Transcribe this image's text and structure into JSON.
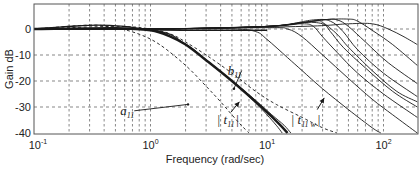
{
  "chart_data": {
    "type": "line",
    "title": "",
    "xlabel": "Frequency (rad/sec)",
    "ylabel": "Gain dB",
    "xscale": "log",
    "xlim": [
      0.1,
      195
    ],
    "ylim": [
      -40,
      10
    ],
    "grid": true,
    "x_ticks": [
      0.1,
      1,
      10,
      100
    ],
    "x_tick_labels": [
      {
        "base": "10",
        "exp": "-1"
      },
      {
        "base": "10",
        "exp": "0"
      },
      {
        "base": "10",
        "exp": "1"
      },
      {
        "base": "10",
        "exp": "2"
      }
    ],
    "y_ticks": [
      0,
      -10,
      -20,
      -30,
      -40
    ],
    "y_tick_labels": [
      "0",
      "-10",
      "-20",
      "-30",
      "-40"
    ],
    "series": [
      {
        "name": "a11",
        "style": "dashed",
        "width": 0.9,
        "points": [
          [
            0.1,
            0
          ],
          [
            0.3,
            1.5
          ],
          [
            0.5,
            0.5
          ],
          [
            0.8,
            -2
          ],
          [
            1.2,
            -6
          ],
          [
            2,
            -14
          ],
          [
            3,
            -22
          ],
          [
            4,
            -28
          ],
          [
            5,
            -33
          ],
          [
            6,
            -37
          ],
          [
            7,
            -40
          ]
        ]
      },
      {
        "name": "b11",
        "style": "dashed",
        "width": 0.9,
        "points": [
          [
            0.1,
            0
          ],
          [
            0.5,
            1
          ],
          [
            1,
            0
          ],
          [
            1.5,
            -2
          ],
          [
            2,
            -5
          ],
          [
            3,
            -10
          ],
          [
            5,
            -17
          ],
          [
            8,
            -24
          ],
          [
            12,
            -29
          ],
          [
            20,
            -34
          ],
          [
            30,
            -38
          ],
          [
            40,
            -40
          ]
        ]
      },
      {
        "name": "|t11| (nominal, bold)",
        "style": "solid",
        "width": 2.4,
        "points": [
          [
            0.1,
            0
          ],
          [
            0.5,
            0.3
          ],
          [
            1,
            -0.5
          ],
          [
            1.5,
            -3
          ],
          [
            2,
            -6
          ],
          [
            3,
            -12
          ],
          [
            5,
            -20
          ],
          [
            8,
            -28
          ],
          [
            10,
            -32
          ],
          [
            13,
            -37
          ],
          [
            15,
            -40
          ]
        ]
      },
      {
        "name": "|t11| variant 1",
        "style": "solid",
        "width": 0.9,
        "points": [
          [
            0.1,
            0
          ],
          [
            1,
            -0.5
          ],
          [
            2,
            -6
          ],
          [
            3,
            -12
          ],
          [
            5,
            -20
          ],
          [
            8,
            -28.5
          ],
          [
            10,
            -33
          ],
          [
            12,
            -37
          ],
          [
            13.5,
            -40
          ]
        ]
      },
      {
        "name": "|t11| variant 2",
        "style": "solid",
        "width": 0.9,
        "points": [
          [
            0.1,
            0
          ],
          [
            1,
            -0.4
          ],
          [
            2,
            -5.8
          ],
          [
            3,
            -11.8
          ],
          [
            5,
            -19.8
          ],
          [
            8,
            -27.5
          ],
          [
            11,
            -33
          ],
          [
            14,
            -37
          ],
          [
            16,
            -40
          ]
        ]
      },
      {
        "name": "|t11 w| 1",
        "style": "solid",
        "width": 0.9,
        "points": [
          [
            0.1,
            0
          ],
          [
            1,
            0
          ],
          [
            5,
            0
          ],
          [
            8,
            -1
          ],
          [
            10,
            -4
          ],
          [
            15,
            -11
          ],
          [
            20,
            -16
          ],
          [
            30,
            -23
          ],
          [
            50,
            -31
          ],
          [
            80,
            -38
          ],
          [
            95,
            -40
          ]
        ]
      },
      {
        "name": "|t11 w| 2",
        "style": "solid",
        "width": 0.9,
        "points": [
          [
            0.1,
            0
          ],
          [
            1,
            0
          ],
          [
            10,
            0.5
          ],
          [
            15,
            0
          ],
          [
            20,
            -3
          ],
          [
            30,
            -10
          ],
          [
            50,
            -19
          ],
          [
            80,
            -27
          ],
          [
            120,
            -33
          ],
          [
            195,
            -40
          ]
        ]
      },
      {
        "name": "|t11 w| 3",
        "style": "solid",
        "width": 0.9,
        "points": [
          [
            0.1,
            0
          ],
          [
            1,
            0
          ],
          [
            10,
            1
          ],
          [
            20,
            2
          ],
          [
            25,
            1
          ],
          [
            30,
            -3
          ],
          [
            40,
            -9
          ],
          [
            60,
            -17
          ],
          [
            100,
            -25
          ],
          [
            195,
            -34
          ]
        ]
      },
      {
        "name": "|t11 w| 4",
        "style": "solid",
        "width": 0.9,
        "points": [
          [
            0.1,
            0
          ],
          [
            1,
            0
          ],
          [
            10,
            1
          ],
          [
            20,
            2.5
          ],
          [
            30,
            2
          ],
          [
            35,
            -1
          ],
          [
            45,
            -7
          ],
          [
            70,
            -15
          ],
          [
            120,
            -24
          ],
          [
            195,
            -30
          ]
        ]
      },
      {
        "name": "|t11 w| 5",
        "style": "solid",
        "width": 0.9,
        "points": [
          [
            0.1,
            0
          ],
          [
            1,
            0
          ],
          [
            10,
            1
          ],
          [
            25,
            3
          ],
          [
            30,
            2.5
          ],
          [
            40,
            -2
          ],
          [
            50,
            -7
          ],
          [
            80,
            -16
          ],
          [
            130,
            -24
          ],
          [
            195,
            -28
          ]
        ]
      },
      {
        "name": "|t11 w| 6",
        "style": "solid",
        "width": 0.9,
        "points": [
          [
            0.1,
            0
          ],
          [
            1,
            0
          ],
          [
            10,
            1
          ],
          [
            25,
            3.5
          ],
          [
            35,
            3
          ],
          [
            45,
            -1
          ],
          [
            60,
            -8
          ],
          [
            100,
            -17
          ],
          [
            195,
            -26
          ]
        ]
      },
      {
        "name": "|t11 w| 7",
        "style": "solid",
        "width": 0.9,
        "points": [
          [
            0.1,
            0
          ],
          [
            1,
            0
          ],
          [
            10,
            1
          ],
          [
            30,
            3.5
          ],
          [
            40,
            3.5
          ],
          [
            50,
            1
          ],
          [
            70,
            -5
          ],
          [
            110,
            -13
          ],
          [
            195,
            -21
          ]
        ]
      },
      {
        "name": "|t11 w| 8",
        "style": "solid",
        "width": 0.9,
        "points": [
          [
            0.1,
            0
          ],
          [
            1,
            0
          ],
          [
            10,
            1
          ],
          [
            30,
            3.5
          ],
          [
            50,
            3.8
          ],
          [
            60,
            3
          ],
          [
            80,
            -0.5
          ],
          [
            120,
            -6
          ],
          [
            195,
            -14
          ]
        ]
      },
      {
        "name": "|t11 w| 9",
        "style": "solid",
        "width": 0.9,
        "points": [
          [
            0.1,
            0
          ],
          [
            1,
            0
          ],
          [
            20,
            1
          ],
          [
            50,
            2
          ],
          [
            80,
            2
          ],
          [
            110,
            0
          ],
          [
            150,
            -3
          ],
          [
            195,
            -6
          ]
        ]
      },
      {
        "name": "low-frequency bump",
        "style": "solid",
        "width": 1.4,
        "points": [
          [
            0.1,
            0
          ],
          [
            0.2,
            1
          ],
          [
            0.35,
            1.5
          ],
          [
            0.6,
            1
          ],
          [
            1,
            -0.2
          ],
          [
            3,
            -0.5
          ],
          [
            10,
            -0.5
          ]
        ]
      }
    ],
    "annotations": [
      {
        "text": "a",
        "sub": "11",
        "x": 0.55,
        "y": -33,
        "arrow_to": [
          2.1,
          -29
        ]
      },
      {
        "text": "b",
        "sub": "11",
        "x": 4.6,
        "y": -17.5,
        "arrow_to": [
          5.2,
          -23
        ]
      },
      {
        "text": "| t",
        "sub": "11",
        "tail": "|",
        "x": 3.7,
        "y": -36.5,
        "arrow_from": [
          4.9,
          -32
        ],
        "arrow_to": [
          5.8,
          -28
        ]
      },
      {
        "text": "| t",
        "sub": "11 w",
        "tail": "|",
        "x": 16,
        "y": -36.5,
        "arrow_from": [
          27,
          -31
        ],
        "arrow_to": [
          31,
          -26.5
        ]
      }
    ]
  },
  "axes": {
    "xlabel": "Frequency (rad/sec)",
    "ylabel": "Gain dB"
  }
}
